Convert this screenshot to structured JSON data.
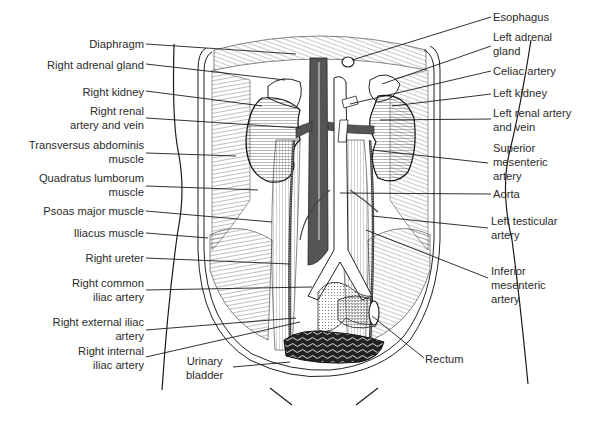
{
  "figure": {
    "vessel_color": "#555555",
    "line_color": "#1a1a1a",
    "text_color": "#2b2b2b"
  },
  "labels_left": [
    {
      "id": "diaphragm",
      "lines": [
        "Diaphragm"
      ]
    },
    {
      "id": "right-adrenal-gland",
      "lines": [
        "Right adrenal gland"
      ]
    },
    {
      "id": "right-kidney",
      "lines": [
        "Right kidney"
      ]
    },
    {
      "id": "right-renal-artery-vein",
      "lines": [
        "Right renal",
        "artery and vein"
      ]
    },
    {
      "id": "transversus-abdominis",
      "lines": [
        "Transversus abdominis",
        "muscle"
      ]
    },
    {
      "id": "quadratus-lumborum",
      "lines": [
        "Quadratus lumborum",
        "muscle"
      ]
    },
    {
      "id": "psoas-major",
      "lines": [
        "Psoas major muscle"
      ]
    },
    {
      "id": "iliacus",
      "lines": [
        "Iliacus muscle"
      ]
    },
    {
      "id": "right-ureter",
      "lines": [
        "Right ureter"
      ]
    },
    {
      "id": "right-common-iliac",
      "lines": [
        "Right common",
        "iliac artery"
      ]
    },
    {
      "id": "right-external-iliac",
      "lines": [
        "Right external iliac",
        "artery"
      ]
    },
    {
      "id": "right-internal-iliac",
      "lines": [
        "Right internal",
        "iliac artery"
      ]
    }
  ],
  "labels_bottom": [
    {
      "id": "urinary-bladder",
      "lines": [
        "Urinary",
        "bladder"
      ]
    },
    {
      "id": "rectum",
      "lines": [
        "Rectum"
      ]
    }
  ],
  "labels_right": [
    {
      "id": "esophagus",
      "lines": [
        "Esophagus"
      ]
    },
    {
      "id": "left-adrenal-gland",
      "lines": [
        "Left adrenal",
        "gland"
      ]
    },
    {
      "id": "celiac-artery",
      "lines": [
        "Celiac artery"
      ]
    },
    {
      "id": "left-kidney",
      "lines": [
        "Left kidney"
      ]
    },
    {
      "id": "left-renal-artery-vein",
      "lines": [
        "Left renal artery",
        "and vein"
      ]
    },
    {
      "id": "superior-mesenteric",
      "lines": [
        "Superior",
        "mesenteric",
        "artery"
      ]
    },
    {
      "id": "aorta",
      "lines": [
        "Aorta"
      ]
    },
    {
      "id": "left-testicular",
      "lines": [
        "Left testicular",
        "artery"
      ]
    },
    {
      "id": "inferior-mesenteric",
      "lines": [
        "Inferior",
        "mesenteric",
        "artery"
      ]
    }
  ]
}
